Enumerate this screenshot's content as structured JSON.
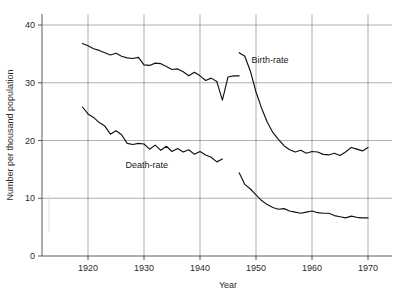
{
  "chart_data": {
    "type": "line",
    "title": "",
    "xlabel": "Year",
    "ylabel": "Number per thousand population",
    "xlim": [
      1914,
      1971
    ],
    "ylim": [
      0,
      42
    ],
    "xticks": [
      1920,
      1930,
      1940,
      1950,
      1960,
      1970
    ],
    "xtick_labels": [
      "1920",
      "1930",
      "1940",
      "1950",
      "1960",
      "1970"
    ],
    "yticks": [
      0,
      10,
      20,
      30,
      40
    ],
    "ytick_labels": [
      "0",
      "10",
      "20",
      "30",
      "40"
    ],
    "grid": "horizontal-and-vertical-at-decades",
    "legend_position": "inline-annotation",
    "annotations": [
      {
        "text": "Birth-rate",
        "x": 1952.5,
        "y": 33.5
      },
      {
        "text": "Death-rate",
        "x": 1930.5,
        "y": 15.3
      }
    ],
    "series": [
      {
        "name": "Birth-rate (pre-war)",
        "label": "Birth-rate",
        "color": "#111111",
        "x": [
          1919,
          1920,
          1921,
          1922,
          1923,
          1924,
          1925,
          1926,
          1927,
          1928,
          1929,
          1930,
          1931,
          1932,
          1933,
          1934,
          1935,
          1936,
          1937,
          1938,
          1939,
          1940,
          1941,
          1942,
          1943
        ],
        "y": [
          36.8,
          36.4,
          35.9,
          35.6,
          35.2,
          34.8,
          35.1,
          34.6,
          34.3,
          34.2,
          34.4,
          33.1,
          33.0,
          33.4,
          33.3,
          32.8,
          32.3,
          32.4,
          31.9,
          31.2,
          31.8,
          31.2,
          30.4,
          30.8,
          30.2
        ],
        "x2": [
          1943,
          1944,
          1945,
          1946,
          1947
        ],
        "y2": [
          30.2,
          27.0,
          31.0,
          31.2,
          31.2
        ]
      },
      {
        "name": "Birth-rate (post-war)",
        "label": "Birth-rate",
        "color": "#111111",
        "x": [
          1947,
          1948,
          1949,
          1950,
          1951,
          1952,
          1953,
          1954,
          1955,
          1956,
          1957,
          1958,
          1959,
          1960,
          1961,
          1962,
          1963,
          1964,
          1965,
          1966,
          1967,
          1968,
          1969,
          1970
        ],
        "y": [
          35.2,
          34.6,
          32.0,
          28.4,
          25.6,
          23.2,
          21.4,
          20.2,
          19.1,
          18.4,
          18.0,
          18.3,
          17.8,
          18.1,
          18.0,
          17.6,
          17.5,
          17.8,
          17.4,
          18.0,
          18.8,
          18.5,
          18.2,
          18.8
        ]
      },
      {
        "name": "Death-rate (pre-war)",
        "label": "Death-rate",
        "color": "#111111",
        "x": [
          1919,
          1920,
          1921,
          1922,
          1923,
          1924,
          1925,
          1926,
          1927,
          1928,
          1929,
          1930,
          1931,
          1932,
          1933,
          1934,
          1935,
          1936,
          1937,
          1938,
          1939,
          1940,
          1941,
          1942,
          1943,
          1944
        ],
        "y": [
          25.8,
          24.6,
          24.0,
          23.1,
          22.5,
          21.1,
          21.7,
          21.0,
          19.5,
          19.3,
          19.5,
          19.4,
          18.5,
          19.2,
          18.3,
          19.0,
          18.1,
          18.6,
          18.0,
          18.4,
          17.6,
          18.1,
          17.5,
          17.1,
          16.3,
          16.8
        ]
      },
      {
        "name": "Death-rate (post-war)",
        "label": "Death-rate",
        "color": "#111111",
        "x": [
          1947,
          1948,
          1949,
          1950,
          1951,
          1952,
          1953,
          1954,
          1955,
          1956,
          1957,
          1958,
          1959,
          1960,
          1961,
          1962,
          1963,
          1964,
          1965,
          1966,
          1967,
          1968,
          1969,
          1970
        ],
        "y": [
          14.4,
          12.4,
          11.6,
          10.6,
          9.6,
          8.9,
          8.4,
          8.1,
          8.2,
          7.8,
          7.6,
          7.4,
          7.6,
          7.8,
          7.5,
          7.4,
          7.4,
          7.0,
          6.8,
          6.6,
          6.9,
          6.7,
          6.6,
          6.6
        ]
      }
    ]
  }
}
